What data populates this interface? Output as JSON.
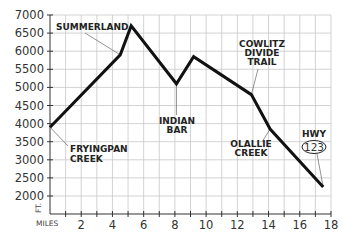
{
  "chart_data": {
    "type": "line",
    "title": "",
    "xlabel": "MILES",
    "ylabel": "FT.",
    "xlim": [
      0,
      18
    ],
    "ylim": [
      1700,
      7000
    ],
    "grid": true,
    "x_ticks": [
      "2",
      "4",
      "6",
      "8",
      "10",
      "12",
      "14",
      "16",
      "18"
    ],
    "y_ticks": [
      "7000",
      "6500",
      "6000",
      "5500",
      "5000",
      "4500",
      "4000",
      "3500",
      "3000",
      "2500",
      "2000"
    ],
    "x": [
      0,
      4.5,
      5.2,
      8.1,
      9.2,
      12.9,
      14.1,
      17.5
    ],
    "values": [
      3900,
      5900,
      6700,
      5100,
      5850,
      4800,
      3850,
      2250
    ],
    "annotations": [
      {
        "text": "SUMMERLAND",
        "x": 4.5,
        "y": 5900
      },
      {
        "text": "FRYINGPAN CREEK",
        "x": 0,
        "y": 3900
      },
      {
        "text": "INDIAN BAR",
        "x": 8.1,
        "y": 5100
      },
      {
        "text": "COWLITZ DIVIDE TRAIL",
        "x": 12.9,
        "y": 4800
      },
      {
        "text": "OLALLIE CREEK",
        "x": 14.1,
        "y": 3850
      },
      {
        "text": "HWY 123",
        "x": 17.5,
        "y": 2250
      }
    ]
  },
  "labels": {
    "summerland": "SUMMERLAND",
    "fryingpan_1": "FRYINGPAN",
    "fryingpan_2": "CREEK",
    "indian_1": "INDIAN",
    "indian_2": "BAR",
    "cowlitz_1": "COWLITZ",
    "cowlitz_2": "DIVIDE",
    "cowlitz_3": "TRAIL",
    "olallie_1": "OLALLIE",
    "olallie_2": "CREEK",
    "hwy": "HWY",
    "hwy_num": "123",
    "miles": "MILES",
    "ft": "FT."
  }
}
